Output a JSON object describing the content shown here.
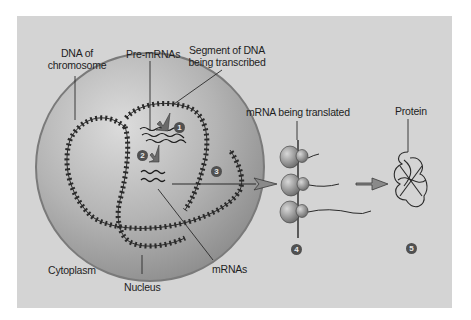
{
  "diagram": {
    "colors": {
      "page_background": "#ffffff",
      "panel_background": "#d4d4d4",
      "nucleus_fill_light": "#c9c9c9",
      "nucleus_fill_dark": "#8e8e8e",
      "nucleus_rim": "#7a7a7a",
      "line": "#2a2a2a",
      "badge": "#505050",
      "ribosome": "#8a8a8a"
    },
    "labels": {
      "dna_of_chromosome_line1": "DNA of",
      "dna_of_chromosome_line2": "chromosome",
      "pre_mrnas": "Pre-mRNAs",
      "segment_line1": "Segment of DNA",
      "segment_line2": "being transcribed",
      "mrna_being_translated": "mRNA being translated",
      "protein": "Protein",
      "cytoplasm": "Cytoplasm",
      "nucleus": "Nucleus",
      "mrnas": "mRNAs"
    },
    "steps": [
      {
        "number": "1",
        "meaning": "Transcription of DNA segment into pre-mRNA"
      },
      {
        "number": "2",
        "meaning": "Processing of pre-mRNA into mRNA"
      },
      {
        "number": "3",
        "meaning": "Export of mRNA from nucleus to cytoplasm"
      },
      {
        "number": "4",
        "meaning": "Translation of mRNA by ribosomes"
      },
      {
        "number": "5",
        "meaning": "Folded protein"
      }
    ]
  }
}
